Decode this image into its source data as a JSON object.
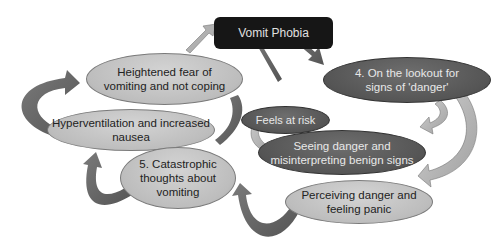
{
  "diagram": {
    "title": "Vomit Phobia",
    "nodes": [
      {
        "id": "heightened-fear",
        "label": "Heightened fear of vomiting and not coping"
      },
      {
        "id": "feels-at-risk",
        "label": "Feels at risk"
      },
      {
        "id": "lookout",
        "label": "4. On the lookout for signs of 'danger'"
      },
      {
        "id": "hyperventilation",
        "label": "Hyperventilation and increased nausea"
      },
      {
        "id": "seeing-danger",
        "label": "Seeing danger and misinterpreting benign signs"
      },
      {
        "id": "catastrophic",
        "label": "5. Catastrophic thoughts about vomiting"
      },
      {
        "id": "perceiving-danger",
        "label": "Perceiving danger and feeling panic"
      }
    ],
    "colors": {
      "background": "#ffffff",
      "title_box": "#161616",
      "light_node": "#c4c4c4",
      "dark_node": "#575757",
      "arrow_dark": "#6a6a6a",
      "arrow_light": "#b8b8b8"
    }
  }
}
